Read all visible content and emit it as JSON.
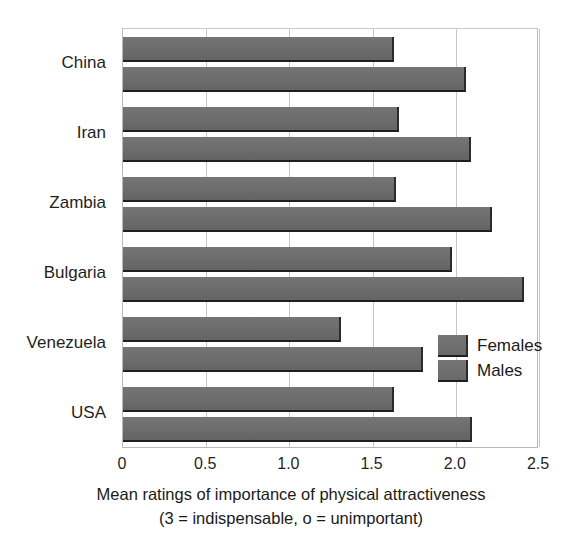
{
  "chart_data": {
    "type": "bar",
    "orientation": "horizontal",
    "title": "",
    "subtitle": "",
    "xlabel": "Mean ratings of importance of physical attractiveness",
    "xlabel_line2": "(3 = indispensable, o = unimportant)",
    "ylabel": "",
    "categories": [
      "China",
      "Iran",
      "Zambia",
      "Bulgaria",
      "Venezuela",
      "USA"
    ],
    "series": [
      {
        "name": "Females",
        "values": [
          1.63,
          1.66,
          1.64,
          1.98,
          1.31,
          1.63
        ]
      },
      {
        "name": "Males",
        "values": [
          2.06,
          2.09,
          2.22,
          2.41,
          1.8,
          2.1
        ]
      }
    ],
    "xlim": [
      0,
      2.5
    ],
    "xticks": [
      0,
      0.5,
      1.0,
      1.5,
      2.0,
      2.5
    ],
    "xtick_labels": [
      "0",
      "0.5",
      "1.0",
      "1.5",
      "2.0",
      "2.5"
    ],
    "grid": true,
    "grid_axis": "x",
    "legend_position": "inner-right",
    "bar_color": "#6e6e6e",
    "bar_edge_color": "#1f1f1f",
    "grid_color": "#c6c6c6",
    "axis_color": "#b9b9b9",
    "background_color": "#ffffff",
    "text_color": "#1a1a1a"
  },
  "legend": {
    "entries": [
      {
        "label": "Females"
      },
      {
        "label": "Males"
      }
    ]
  }
}
